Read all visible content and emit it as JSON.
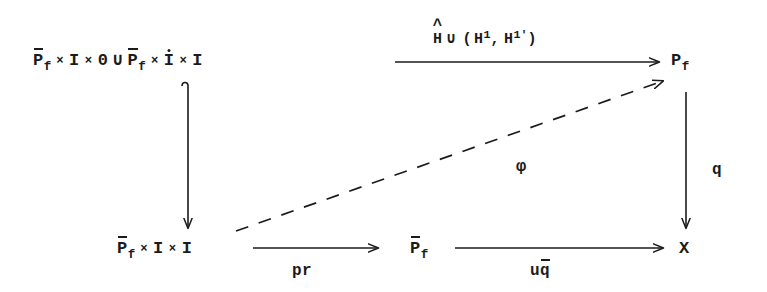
{
  "diagram": {
    "type": "commutative-diagram",
    "background_color": "#ffffff",
    "ink_color": "#1b1b1b",
    "nodes": {
      "top_left": {
        "id": "top-left-object",
        "text": "P̄_f × I × 0 ∪ P̄_f × İ × I",
        "parts": {
          "p_bar": "P",
          "sub_f": "f",
          "times": "×",
          "I": "I",
          "zero": "0",
          "cup": "∪",
          "I_dot": "I",
          "I_last": "I"
        }
      },
      "top_right": {
        "id": "top-right-object",
        "text": "P_f",
        "base": "P",
        "sub": "f"
      },
      "bottom_left": {
        "id": "bottom-left-object",
        "text": "P̄_f × I × I",
        "base": "P",
        "sub": "f",
        "times": "×",
        "I_first": "I",
        "I_second": "I"
      },
      "bottom_middle": {
        "id": "bottom-middle-object",
        "text": "P̄_f",
        "base": "P",
        "sub": "f"
      },
      "bottom_right": {
        "id": "bottom-right-object",
        "text": "X"
      }
    },
    "arrows": {
      "top": {
        "id": "top-horizontal-arrow",
        "style": "solid",
        "direction": "right",
        "from": "top_left",
        "to": "top_right",
        "label": {
          "text": "Ĥ ∪ (H¹, H¹')",
          "hat_base": "H",
          "cup": "∪",
          "open_paren": "(",
          "h1_base": "H",
          "h1_sup": "1",
          "comma": ",",
          "h1p_base": "H",
          "h1p_sup": "1'",
          "close_paren": ")"
        }
      },
      "left_vertical": {
        "id": "left-vertical-arrow",
        "style": "solid-hooked",
        "direction": "down",
        "from": "top_left",
        "to": "bottom_left",
        "label": ""
      },
      "right_vertical": {
        "id": "right-vertical-arrow",
        "style": "solid",
        "direction": "down",
        "from": "top_right",
        "to": "bottom_right",
        "label": {
          "text": "q"
        }
      },
      "bottom_left_arrow": {
        "id": "bottom-left-horizontal-arrow",
        "style": "solid",
        "direction": "right",
        "from": "bottom_left",
        "to": "bottom_middle",
        "label": {
          "text": "pr"
        }
      },
      "bottom_right_arrow": {
        "id": "bottom-right-horizontal-arrow",
        "style": "solid",
        "direction": "right",
        "from": "bottom_middle",
        "to": "bottom_right",
        "label": {
          "text": "uq̄",
          "u": "u",
          "q_bar": "q"
        }
      },
      "diagonal": {
        "id": "diagonal-dashed-arrow",
        "style": "dashed",
        "direction": "up-right",
        "from": "bottom_left",
        "to": "top_right",
        "label": {
          "text": "φ"
        }
      }
    }
  }
}
